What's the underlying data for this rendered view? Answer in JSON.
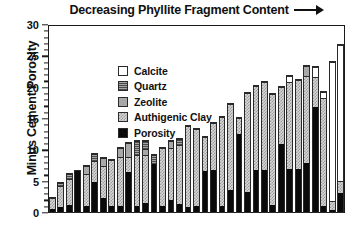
{
  "chart_data": {
    "type": "bar",
    "subtype": "stacked-bar",
    "title_text": "Decreasing Phyllite Fragment Content",
    "title_arrow": "right-arrow",
    "xlabel": "",
    "ylabel": "Minus Cement Porosity",
    "ylim": [
      0,
      30
    ],
    "yticks": [
      0,
      5,
      10,
      15,
      20,
      25,
      30
    ],
    "ytick_labels": [
      "0",
      "5",
      "10",
      "15",
      "20",
      "25",
      "30"
    ],
    "y_minor_tick_step": 1,
    "grid": false,
    "x_axis_ticks": false,
    "x_tick_labels": [],
    "legend_position": "upper-left-inside",
    "stack_order_bottom_to_top": [
      "Porosity",
      "Authigenic Clay",
      "Zeolite",
      "Quartz",
      "Calcite"
    ],
    "series": [
      {
        "name": "Porosity",
        "color": "#0a0a0a",
        "fill": "solid-black",
        "values": [
          0.6,
          0.8,
          1.1,
          6.8,
          1.0,
          5.0,
          2.3,
          1.0,
          1.0,
          6.6,
          1.0,
          1.5,
          8.0,
          1.0,
          2.0,
          1.3,
          0.8,
          1.0,
          6.8,
          6.8,
          1.0,
          3.5,
          12.7,
          3.3,
          6.8,
          6.8,
          1.2,
          11.0,
          6.9,
          6.9,
          8.0,
          17.0,
          1.0,
          0.3,
          3.0
        ]
      },
      {
        "name": "Authigenic Clay",
        "color": "#d7d7d7",
        "fill": "fine-checker",
        "values": [
          1.9,
          3.7,
          4.5,
          0.0,
          5.4,
          3.4,
          5.4,
          7.6,
          8.0,
          2.5,
          8.3,
          7.9,
          0.0,
          9.5,
          8.5,
          9.7,
          13.3,
          12.5,
          5.5,
          7.7,
          14.5,
          14.0,
          2.6,
          16.0,
          13.7,
          14.2,
          18.0,
          9.2,
          14.1,
          14.5,
          14.0,
          4.8,
          17.5,
          1.5,
          2.0
        ]
      },
      {
        "name": "Zeolite",
        "color": "#a8a8a8",
        "fill": "solid-gray",
        "values": [
          0.0,
          0.0,
          0.0,
          0.0,
          1.2,
          0.0,
          1.3,
          0.0,
          1.6,
          2.2,
          0.0,
          1.0,
          0.0,
          0.0,
          1.2,
          0.0,
          0.0,
          0.0,
          0.0,
          0.0,
          0.0,
          0.0,
          0.0,
          0.0,
          0.0,
          0.0,
          0.0,
          0.0,
          0.0,
          0.0,
          1.6,
          0.0,
          0.0,
          0.0,
          0.0
        ]
      },
      {
        "name": "Quartz",
        "color": "#777777",
        "fill": "horizontal-lines",
        "values": [
          0.0,
          0.5,
          0.8,
          0.0,
          0.0,
          1.2,
          0.0,
          0.0,
          0.0,
          0.0,
          2.3,
          1.2,
          1.4,
          0.0,
          0.0,
          1.0,
          0.0,
          0.0,
          0.0,
          0.0,
          0.0,
          0.0,
          0.0,
          0.0,
          0.0,
          0.0,
          0.0,
          0.0,
          0.0,
          0.0,
          0.0,
          0.0,
          0.0,
          0.0,
          0.0
        ]
      },
      {
        "name": "Calcite",
        "color": "#ffffff",
        "fill": "white",
        "values": [
          0.0,
          0.0,
          0.0,
          0.0,
          0.0,
          0.0,
          0.0,
          0.0,
          0.0,
          0.0,
          0.0,
          0.0,
          0.0,
          0.0,
          0.0,
          0.0,
          0.0,
          0.0,
          0.0,
          0.0,
          0.0,
          0.0,
          0.0,
          0.0,
          0.0,
          0.0,
          0.0,
          0.0,
          1.1,
          0.0,
          0.0,
          1.6,
          0.9,
          22.5,
          22.0
        ]
      }
    ],
    "bar_totals": [
      2.5,
      5.0,
      6.4,
      6.8,
      7.6,
      9.6,
      9.0,
      8.6,
      10.6,
      11.3,
      11.6,
      11.6,
      9.4,
      10.5,
      11.7,
      12.0,
      14.1,
      13.5,
      12.3,
      14.5,
      15.5,
      17.5,
      15.3,
      19.3,
      20.5,
      21.0,
      19.2,
      20.2,
      22.1,
      21.4,
      23.6,
      23.4,
      19.4,
      24.3,
      27.0
    ],
    "bar_count": 35
  },
  "legend": {
    "items": [
      {
        "label": "Calcite",
        "swatch": "sw-calcite"
      },
      {
        "label": "Quartz",
        "swatch": "sw-quartz"
      },
      {
        "label": "Zeolite",
        "swatch": "sw-zeolite"
      },
      {
        "label": "Authigenic Clay",
        "swatch": "sw-clay"
      },
      {
        "label": "Porosity",
        "swatch": "sw-porosity"
      }
    ]
  }
}
